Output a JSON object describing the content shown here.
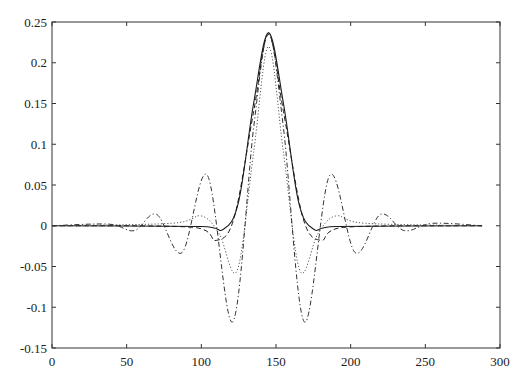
{
  "chart_data": {
    "type": "line",
    "title": "",
    "xlabel": "",
    "ylabel": "",
    "xlim": [
      0,
      300
    ],
    "ylim": [
      -0.15,
      0.25
    ],
    "grid": false,
    "legend": null,
    "x_ticks": [
      0,
      50,
      100,
      150,
      200,
      250,
      300
    ],
    "x_tick_labels": [
      "0",
      "50",
      "100",
      "150",
      "200",
      "250",
      "300"
    ],
    "y_ticks": [
      -0.15,
      -0.1,
      -0.05,
      0,
      0.05,
      0.1,
      0.15,
      0.2,
      0.25
    ],
    "y_tick_labels": [
      "-0.15",
      "-0.1",
      "-0.05",
      "0",
      "0.05",
      "0.1",
      "0.15",
      "0.2",
      "0.25"
    ],
    "x_range_data": [
      0,
      288
    ],
    "center": 145,
    "series": [
      {
        "name": "solid",
        "style": "solid",
        "color": "#1a1a1a",
        "peak": 0.237,
        "points": [
          [
            0,
            0
          ],
          [
            100,
            -0.001
          ],
          [
            115,
            -0.004
          ],
          [
            125,
            0.03
          ],
          [
            135,
            0.15
          ],
          [
            145,
            0.237
          ],
          [
            155,
            0.15
          ],
          [
            165,
            0.03
          ],
          [
            175,
            -0.004
          ],
          [
            190,
            -0.001
          ],
          [
            288,
            0
          ]
        ]
      },
      {
        "name": "dashed",
        "style": "dashed",
        "color": "#1a1a1a",
        "peak": 0.235,
        "points": [
          [
            0,
            0
          ],
          [
            95,
            -0.002
          ],
          [
            110,
            -0.018
          ],
          [
            122,
            0.01
          ],
          [
            135,
            0.14
          ],
          [
            145,
            0.235
          ],
          [
            155,
            0.14
          ],
          [
            168,
            0.01
          ],
          [
            180,
            -0.018
          ],
          [
            195,
            -0.002
          ],
          [
            288,
            0
          ]
        ]
      },
      {
        "name": "dotted",
        "style": "dotted",
        "color": "#555555",
        "peak": 0.22,
        "points": [
          [
            0,
            0
          ],
          [
            80,
            0.003
          ],
          [
            100,
            0.012
          ],
          [
            112,
            -0.01
          ],
          [
            124,
            -0.055
          ],
          [
            135,
            0.09
          ],
          [
            145,
            0.22
          ],
          [
            155,
            0.09
          ],
          [
            166,
            -0.055
          ],
          [
            178,
            -0.01
          ],
          [
            190,
            0.012
          ],
          [
            210,
            0.003
          ],
          [
            288,
            0
          ]
        ]
      },
      {
        "name": "dash-dot",
        "style": "dashdot",
        "color": "#333333",
        "peak": 0.235,
        "points": [
          [
            0,
            0
          ],
          [
            38,
            0.002
          ],
          [
            55,
            -0.006
          ],
          [
            70,
            0.014
          ],
          [
            87,
            -0.033
          ],
          [
            104,
            0.062
          ],
          [
            121,
            -0.118
          ],
          [
            135,
            0.12
          ],
          [
            145,
            0.235
          ],
          [
            155,
            0.12
          ],
          [
            169,
            -0.118
          ],
          [
            186,
            0.062
          ],
          [
            203,
            -0.033
          ],
          [
            220,
            0.014
          ],
          [
            236,
            -0.006
          ],
          [
            255,
            0.003
          ],
          [
            288,
            0
          ]
        ]
      }
    ]
  }
}
